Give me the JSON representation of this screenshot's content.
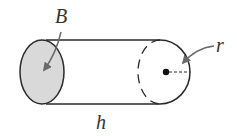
{
  "diagram": {
    "labels": {
      "base": "B",
      "radius": "r",
      "height": "h"
    },
    "colors": {
      "stroke": "#2a2a2a",
      "base_fill": "#d9d9d9",
      "arrow": "#6a6a6a",
      "text": "#333333"
    }
  }
}
